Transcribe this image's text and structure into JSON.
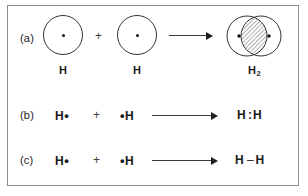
{
  "figure": {
    "background_color": "#ffffff",
    "frame_color": "#8c8c8c",
    "ink_color": "#1a1a1a"
  },
  "rows": {
    "a": {
      "tag": "(a)",
      "style": "orbital-overlap",
      "reactant1_label": "H",
      "reactant2_label": "H",
      "plus": "+",
      "arrow": "reaction-arrow",
      "product_label": "H",
      "product_subscript": "2",
      "overlap_fill": "diagonal-hatch",
      "nucleus_icon": "nucleus-dot"
    },
    "b": {
      "tag": "(b)",
      "style": "lewis-dot",
      "reactant1": "H",
      "reactant1_dot": "•",
      "plus": "+",
      "reactant2_dot": "•",
      "reactant2": "H",
      "arrow": "reaction-arrow",
      "product_left": "H",
      "product_sep": ":",
      "product_right": "H"
    },
    "c": {
      "tag": "(c)",
      "style": "line-structure",
      "reactant1": "H",
      "reactant1_dot": "•",
      "plus": "+",
      "reactant2_dot": "•",
      "reactant2": "H",
      "arrow": "reaction-arrow",
      "product_left": "H",
      "product_sep": "–",
      "product_right": "H"
    }
  }
}
